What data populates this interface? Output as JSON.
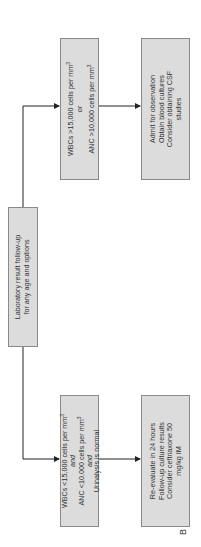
{
  "root": {
    "line1": "Laboratory result follow-up",
    "line2": "for any age and options"
  },
  "high": {
    "line1": "WBCs >15,000 cells per mm",
    "sup1": "3",
    "connector": "or",
    "line2": "ANC >10,000 cells per mm",
    "sup2": "3"
  },
  "high_action": {
    "lines": [
      "Admit for observation",
      "Obtain blood cultures",
      "Consider obtaining CSF",
      "studies"
    ]
  },
  "low": {
    "line1": "WBCs <15,000 cells per mm",
    "sup1": "3",
    "connector1": "and",
    "line2": "ANC <10,000 cells per mm",
    "sup2": "3",
    "connector2": "and",
    "line3": "Urinalysis is normal"
  },
  "low_action": {
    "lines": [
      "Re-evaluate in 24 hours",
      "Follow-up culture results",
      "Consider ceftriaxone 50",
      "mg/kg IM"
    ]
  },
  "panel_label": "B"
}
